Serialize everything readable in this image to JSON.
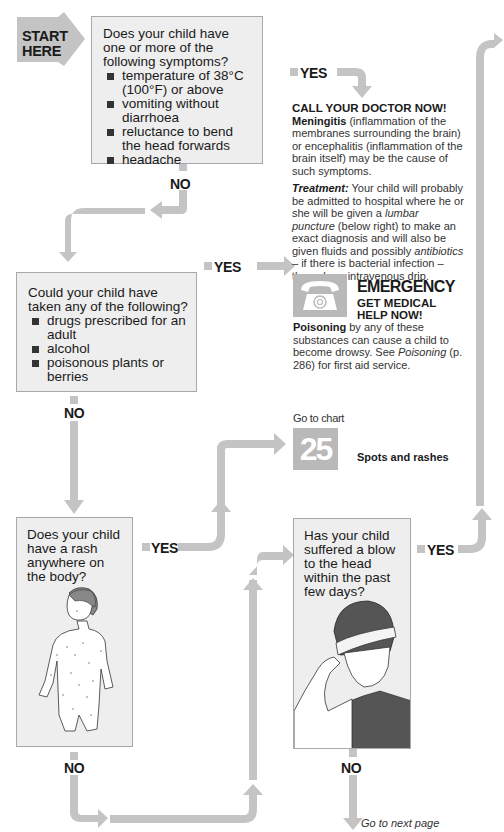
{
  "start": {
    "label_line1": "START",
    "label_line2": "HERE"
  },
  "q1": {
    "question": "Does your child have one or more of the following symptoms?",
    "items": [
      "temperature of 38°C (100°F) or above",
      "vomiting without diarrhoea",
      "reluctance to bend the head forwards",
      "headache"
    ],
    "yes_label": "YES",
    "no_label": "NO"
  },
  "meningitis": {
    "heading": "CALL YOUR DOCTOR NOW!",
    "term": "Meningitis",
    "text": " (inflammation of the membranes surrounding the brain) or encephalitis (inflammation of the brain itself) may be the cause of such symptoms.",
    "treatment_label": "Treatment:",
    "treatment_1": " Your child will probably be admitted to hospital where he or she will be given a ",
    "treatment_em1": "lumbar puncture",
    "treatment_2": " (below right) to make an exact diagnosis and will also be given fluids and possibly ",
    "treatment_em2": "antibiotics",
    "treatment_3": " – if there is bacterial infection – through an intravenous drip."
  },
  "q2": {
    "question": "Could your child have taken any of the following?",
    "items": [
      "drugs prescribed for an adult",
      "alcohol",
      "poisonous plants or berries"
    ],
    "yes_label": "YES",
    "no_label": "NO"
  },
  "emergency": {
    "icon": "telephone-icon",
    "title": "EMERGENCY",
    "subtitle_line1": "GET MEDICAL",
    "subtitle_line2": "HELP NOW!",
    "term": "Poisoning",
    "text": " by any of these substances can cause a child to become drowsy. See ",
    "link": "Poisoning",
    "text2": " (p. 286) for first aid service."
  },
  "chart_link": {
    "goto_label": "Go to chart",
    "number": "25",
    "title": "Spots and rashes"
  },
  "q3": {
    "question": "Does your child have a rash anywhere on the body?",
    "yes_label": "YES",
    "no_label": "NO",
    "illustration": "child-with-rash-illustration"
  },
  "q4": {
    "question": "Has your child suffered a blow to the head within the past few days?",
    "yes_label": "YES",
    "no_label": "NO",
    "illustration": "child-with-head-bandage-illustration"
  },
  "footer": {
    "next_page": "Go to next page"
  },
  "colors": {
    "arrow": "#c4c4c4",
    "box_bg": "#eeeeee",
    "box_border": "#a8a8a8",
    "badge": "#b9b9b9"
  }
}
